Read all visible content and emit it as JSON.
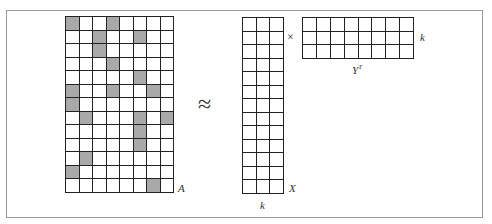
{
  "diagram": {
    "type": "matrix-factorization",
    "approx_symbol": "≈",
    "times_symbol": "×",
    "colors": {
      "shade": "#a9a9a9",
      "grid_line": "#222222",
      "frame": "#9a9a9a"
    },
    "matrix_A": {
      "label": "A",
      "rows": 13,
      "cols": 8,
      "shaded": [
        [
          0,
          0
        ],
        [
          0,
          3
        ],
        [
          1,
          2
        ],
        [
          1,
          5
        ],
        [
          2,
          2
        ],
        [
          3,
          3
        ],
        [
          4,
          5
        ],
        [
          5,
          0
        ],
        [
          5,
          3
        ],
        [
          5,
          6
        ],
        [
          6,
          0
        ],
        [
          7,
          1
        ],
        [
          7,
          5
        ],
        [
          7,
          7
        ],
        [
          8,
          5
        ],
        [
          9,
          5
        ],
        [
          10,
          1
        ],
        [
          11,
          0
        ],
        [
          12,
          6
        ]
      ]
    },
    "matrix_X": {
      "label": "X",
      "rows": 13,
      "cols": 3,
      "dim_label": "k"
    },
    "matrix_YT": {
      "label": "Y",
      "label_sup": "T",
      "rows": 3,
      "cols": 8,
      "dim_label": "k"
    }
  }
}
